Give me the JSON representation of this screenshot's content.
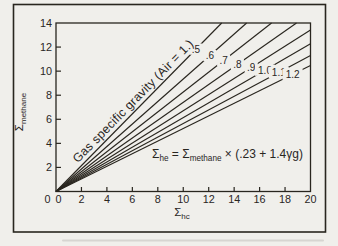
{
  "figure": {
    "paper_color": "#f0efeb",
    "ink_color": "#29261f",
    "family_label": "Gas specific gravity (Air = 1.)",
    "equation": {
      "lhs_base": "Σ",
      "lhs_sub": "he",
      "equals": " = ",
      "rhs_base": "Σ",
      "rhs_sub": "methane",
      "factor": " × (.23 + 1.4γg)"
    }
  },
  "chart_data": {
    "type": "line",
    "title": "",
    "annotation": "Gas specific gravity (Air = 1.)",
    "relation": "Σhe = Σmethane × (.23 + 1.4γg)",
    "xlabel": "Σhc",
    "ylabel": "Σmethane",
    "x_axis": {
      "label_base": "Σ",
      "label_sub": "hc",
      "min": 0,
      "max": 20,
      "tick_step": 2,
      "ticks": [
        0,
        2,
        4,
        6,
        8,
        10,
        12,
        14,
        16,
        18,
        20
      ]
    },
    "y_axis": {
      "label_base": "Σ",
      "label_sub": "methane",
      "min": 0,
      "max": 14,
      "tick_step": 2,
      "ticks": [
        0,
        2,
        4,
        6,
        8,
        10,
        12,
        14
      ]
    },
    "grid": false,
    "legend_position": "labels-on-lines",
    "series": [
      {
        "label": ".5",
        "gravity": 0.5,
        "sigma_hc_per_sigma_methane": 0.93
      },
      {
        "label": ".6",
        "gravity": 0.6,
        "sigma_hc_per_sigma_methane": 1.07
      },
      {
        "label": ".7",
        "gravity": 0.7,
        "sigma_hc_per_sigma_methane": 1.21
      },
      {
        "label": ".8",
        "gravity": 0.8,
        "sigma_hc_per_sigma_methane": 1.35
      },
      {
        "label": ".9",
        "gravity": 0.9,
        "sigma_hc_per_sigma_methane": 1.49
      },
      {
        "label": "1.0",
        "gravity": 1.0,
        "sigma_hc_per_sigma_methane": 1.63
      },
      {
        "label": "1.1",
        "gravity": 1.1,
        "sigma_hc_per_sigma_methane": 1.77
      },
      {
        "label": "1.2",
        "gravity": 1.2,
        "sigma_hc_per_sigma_methane": 1.91
      }
    ]
  }
}
